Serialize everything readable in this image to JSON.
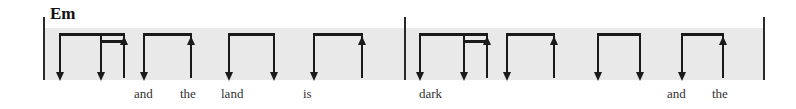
{
  "notation": {
    "type": "strum-pattern",
    "width": 796,
    "height": 109,
    "colors": {
      "band": "#e9e9e9",
      "ink": "#1a1a1a",
      "barline": "#2a2a2a",
      "lyric": "#333333",
      "background": "#ffffff"
    },
    "band": {
      "x": 43,
      "y": 28,
      "width": 720,
      "height": 52
    },
    "barlines": [
      {
        "name": "barline-start",
        "x": 43,
        "y": 17,
        "height": 63
      },
      {
        "name": "barline-middle",
        "x": 404,
        "y": 17,
        "height": 63
      },
      {
        "name": "barline-end",
        "x": 763,
        "y": 17,
        "height": 63
      }
    ],
    "chords": [
      {
        "label": "Em",
        "x": 50,
        "y": 5
      }
    ],
    "measures": [
      {
        "index": 1,
        "strums": [
          {
            "direction": "down",
            "x": 59
          },
          {
            "direction": "down",
            "x": 100
          },
          {
            "direction": "up",
            "x": 123
          },
          {
            "direction": "down",
            "x": 143
          },
          {
            "direction": "up",
            "x": 190
          },
          {
            "direction": "down",
            "x": 228
          },
          {
            "direction": "down",
            "x": 273
          },
          {
            "direction": "down",
            "x": 313
          },
          {
            "direction": "up",
            "x": 361
          }
        ],
        "beams": [
          {
            "from": 59,
            "to": 123,
            "level": 1
          },
          {
            "from": 100,
            "to": 123,
            "level": 2
          },
          {
            "from": 143,
            "to": 190,
            "level": 1
          },
          {
            "from": 228,
            "to": 273,
            "level": 1
          },
          {
            "from": 313,
            "to": 361,
            "level": 1
          }
        ]
      },
      {
        "index": 2,
        "strums": [
          {
            "direction": "down",
            "x": 419
          },
          {
            "direction": "down",
            "x": 463
          },
          {
            "direction": "up",
            "x": 486
          },
          {
            "direction": "down",
            "x": 506
          },
          {
            "direction": "up",
            "x": 553
          },
          {
            "direction": "down",
            "x": 597
          },
          {
            "direction": "down",
            "x": 639
          },
          {
            "direction": "down",
            "x": 681
          },
          {
            "direction": "up",
            "x": 722
          }
        ],
        "beams": [
          {
            "from": 419,
            "to": 486,
            "level": 1
          },
          {
            "from": 463,
            "to": 486,
            "level": 2
          },
          {
            "from": 506,
            "to": 553,
            "level": 1
          },
          {
            "from": 597,
            "to": 639,
            "level": 1
          },
          {
            "from": 681,
            "to": 722,
            "level": 1
          }
        ]
      }
    ],
    "lyrics": [
      {
        "text": "and",
        "x": 134
      },
      {
        "text": "the",
        "x": 180
      },
      {
        "text": "land",
        "x": 221
      },
      {
        "text": "is",
        "x": 303
      },
      {
        "text": "dark",
        "x": 419
      },
      {
        "text": "and",
        "x": 667
      },
      {
        "text": "the",
        "x": 712
      }
    ],
    "lyric_baseline_y": 87
  }
}
